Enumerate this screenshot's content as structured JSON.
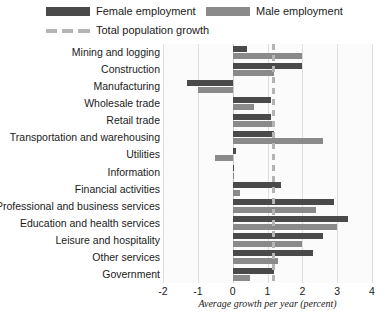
{
  "chart_data": {
    "type": "bar",
    "orientation": "horizontal",
    "title": "",
    "subtitle": "",
    "xlabel": "Average growth per year (percent)",
    "ylabel": "",
    "xlim": [
      -2,
      4
    ],
    "xticks": [
      -2,
      -1,
      0,
      1,
      2,
      3,
      4
    ],
    "xtick_labels": [
      "-2",
      "-1",
      "0",
      "1",
      "2",
      "3",
      "4"
    ],
    "grid": true,
    "grid_axis": "x",
    "legend_position": "top-left",
    "categories": [
      "Mining and logging",
      "Construction",
      "Manufacturing",
      "Wholesale trade",
      "Retail trade",
      "Transportation and warehousing",
      "Utilities",
      "Information",
      "Financial activities",
      "Professional and business services",
      "Education and health services",
      "Leisure and hospitality",
      "Other services",
      "Government"
    ],
    "series": [
      {
        "name": "Female employment",
        "color": "#4a4a4a",
        "values": [
          0.4,
          2.0,
          -1.3,
          1.1,
          1.1,
          1.2,
          0.1,
          0.0,
          1.4,
          2.9,
          3.3,
          2.6,
          2.3,
          1.2
        ]
      },
      {
        "name": "Male employment",
        "color": "#8a8a8a",
        "values": [
          2.0,
          1.2,
          -1.0,
          0.6,
          1.2,
          2.6,
          -0.5,
          0.0,
          0.2,
          2.4,
          3.0,
          2.0,
          1.3,
          0.5
        ]
      }
    ],
    "reference_line": {
      "name": "Total population growth",
      "value": 1.15,
      "style": "dashed",
      "color": "#b4b4b4"
    }
  },
  "legend": {
    "items": [
      {
        "label": "Female employment",
        "swatch": "solid-dark-swatch"
      },
      {
        "label": "Male employment",
        "swatch": "solid-gray-swatch"
      },
      {
        "label": "Total population growth",
        "swatch": "dashed-line-swatch"
      }
    ]
  }
}
